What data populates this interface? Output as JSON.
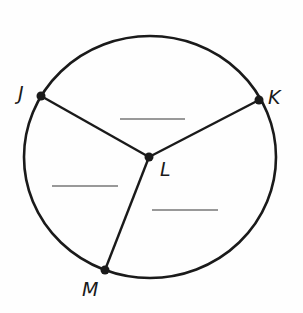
{
  "diagram": {
    "type": "circle-with-radii",
    "circle": {
      "cx": 150,
      "cy": 157,
      "rx": 126,
      "ry": 121
    },
    "center": {
      "label": "L",
      "x": 149,
      "y": 157
    },
    "points": [
      {
        "label": "J",
        "x": 41,
        "y": 96
      },
      {
        "label": "K",
        "x": 259,
        "y": 100
      },
      {
        "label": "M",
        "x": 105,
        "y": 270
      }
    ],
    "segments": [
      {
        "from": "L",
        "to": "J"
      },
      {
        "from": "L",
        "to": "K"
      },
      {
        "from": "L",
        "to": "M"
      }
    ],
    "answer_blanks": [
      {
        "region": "sector JLK",
        "x1": 120,
        "x2": 185,
        "y": 119
      },
      {
        "region": "sector JLM",
        "x1": 52,
        "x2": 118,
        "y": 186
      },
      {
        "region": "sector KLM",
        "x1": 152,
        "x2": 218,
        "y": 210
      }
    ],
    "colors": {
      "stroke": "#1a1a1a",
      "blank": "#777777"
    }
  }
}
